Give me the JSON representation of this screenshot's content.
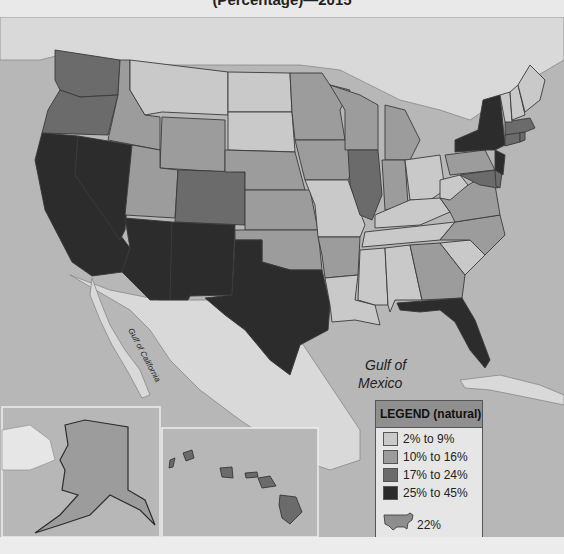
{
  "title": "(Percentage)—2015",
  "labels": {
    "gulf_mexico_line1": "Gulf of",
    "gulf_mexico_line2": "Mexico",
    "gulf_california": "Gulf of California"
  },
  "legend": {
    "title": "LEGEND (natural)",
    "items": [
      {
        "label": "2% to 9%",
        "color": "#c9c9c9"
      },
      {
        "label": "10% to 16%",
        "color": "#9c9c9c"
      },
      {
        "label": "17% to 24%",
        "color": "#6b6b6b"
      },
      {
        "label": "25% to 45%",
        "color": "#2c2c2c"
      }
    ],
    "us_average": "22%"
  },
  "colors": {
    "ocean": "#b7b7b7",
    "foreign_land": "#d9d9d9",
    "border": "#3a3a3a"
  },
  "states": {
    "WA": "17% to 24%",
    "OR": "17% to 24%",
    "CA": "25% to 45%",
    "NV": "25% to 45%",
    "ID": "10% to 16%",
    "MT": "2% to 9%",
    "WY": "2% to 9%",
    "UT": "10% to 16%",
    "CO": "17% to 24%",
    "AZ": "25% to 45%",
    "NM": "25% to 45%",
    "TX": "25% to 45%",
    "ND": "2% to 9%",
    "SD": "2% to 9%",
    "NE": "10% to 16%",
    "KS": "10% to 16%",
    "OK": "10% to 16%",
    "MN": "10% to 16%",
    "IA": "10% to 16%",
    "MO": "2% to 9%",
    "AR": "10% to 16%",
    "LA": "2% to 9%",
    "WI": "10% to 16%",
    "IL": "17% to 24%",
    "MI": "10% to 16%",
    "IN": "10% to 16%",
    "OH": "2% to 9%",
    "KY": "2% to 9%",
    "TN": "2% to 9%",
    "MS": "2% to 9%",
    "AL": "2% to 9%",
    "GA": "10% to 16%",
    "FL": "25% to 45%",
    "SC": "2% to 9%",
    "NC": "10% to 16%",
    "VA": "10% to 16%",
    "WV": "2% to 9%",
    "PA": "10% to 16%",
    "NY": "25% to 45%",
    "NJ": "25% to 45%",
    "MD": "17% to 24%",
    "DE": "17% to 24%",
    "CT": "17% to 24%",
    "RI": "17% to 24%",
    "MA": "17% to 24%",
    "VT": "2% to 9%",
    "NH": "2% to 9%",
    "ME": "2% to 9%",
    "AK": "10% to 16%",
    "HI": "17% to 24%"
  }
}
